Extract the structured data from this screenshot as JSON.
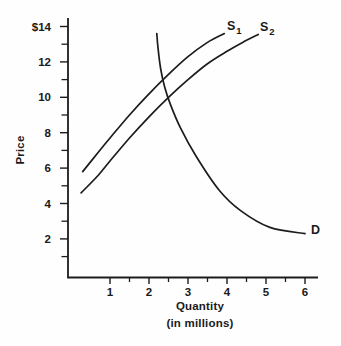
{
  "figure": {
    "background": "#fefefe",
    "ink_color": "#1c1c1c",
    "text_color": "#1a1a1a"
  },
  "chart_data": {
    "type": "line",
    "title": "",
    "xlabel": "Quantity",
    "xlabel_note": "(in millions)",
    "ylabel": "Price",
    "x_range": [
      0,
      6.4
    ],
    "y_range": [
      0,
      14.3
    ],
    "grid": false,
    "legend": "labels-on-curves",
    "x_ticks": [
      {
        "value": 1,
        "label": "1"
      },
      {
        "value": 2,
        "label": "2"
      },
      {
        "value": 3,
        "label": "3"
      },
      {
        "value": 4,
        "label": "4"
      },
      {
        "value": 5,
        "label": "5"
      },
      {
        "value": 6,
        "label": "6"
      }
    ],
    "x_minor_ticks": [
      1.5,
      2.5,
      3.5,
      4.5,
      5.5
    ],
    "y_ticks": [
      {
        "value": 14,
        "label": "$14"
      },
      {
        "value": 12,
        "label": "12"
      },
      {
        "value": 10,
        "label": "10"
      },
      {
        "value": 8,
        "label": "8"
      },
      {
        "value": 6,
        "label": "6"
      },
      {
        "value": 4,
        "label": "4"
      },
      {
        "value": 2,
        "label": "2"
      }
    ],
    "y_minor_ticks": [
      13,
      11,
      9,
      7,
      5,
      3,
      1
    ],
    "series": [
      {
        "id": "S1",
        "name": "S1",
        "role": "supply-curve-1",
        "label": "S",
        "label_sub": "1",
        "points": [
          [
            0.3,
            5.8
          ],
          [
            0.7,
            6.9
          ],
          [
            1.0,
            7.7
          ],
          [
            1.5,
            9.0
          ],
          [
            2.0,
            10.2
          ],
          [
            2.5,
            11.3
          ],
          [
            3.0,
            12.3
          ],
          [
            3.5,
            13.1
          ],
          [
            3.93,
            13.6
          ]
        ]
      },
      {
        "id": "S2",
        "name": "S2",
        "role": "supply-curve-2",
        "label": "S",
        "label_sub": "2",
        "points": [
          [
            0.26,
            4.6
          ],
          [
            0.7,
            5.6
          ],
          [
            1.0,
            6.4
          ],
          [
            1.5,
            7.7
          ],
          [
            2.0,
            8.9
          ],
          [
            2.5,
            10.0
          ],
          [
            3.0,
            11.0
          ],
          [
            3.5,
            11.9
          ],
          [
            4.0,
            12.6
          ],
          [
            4.4,
            13.1
          ],
          [
            4.8,
            13.55
          ]
        ]
      },
      {
        "id": "D",
        "name": "D",
        "role": "demand-curve",
        "label": "D",
        "label_sub": "",
        "points": [
          [
            2.2,
            13.6
          ],
          [
            2.23,
            12.8
          ],
          [
            2.3,
            11.6
          ],
          [
            2.4,
            10.6
          ],
          [
            2.55,
            9.6
          ],
          [
            2.8,
            8.3
          ],
          [
            3.2,
            6.7
          ],
          [
            3.8,
            4.75
          ],
          [
            4.35,
            3.6
          ],
          [
            5.1,
            2.65
          ],
          [
            6.0,
            2.3
          ]
        ]
      }
    ],
    "intersections": [
      {
        "curves": [
          "D",
          "S1"
        ],
        "quantity": 2.33,
        "price": 10.8
      },
      {
        "curves": [
          "D",
          "S2"
        ],
        "quantity": 2.46,
        "price": 9.8
      }
    ]
  }
}
